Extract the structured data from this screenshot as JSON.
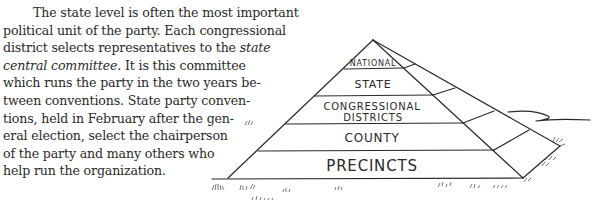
{
  "paragraph": {
    "lines": [
      "The state level is often the most important",
      "political unit of the party. Each congressional",
      "district selects representatives to the ",
      "state",
      "central committee",
      ". It is this committee",
      "which runs the party in the two years be-",
      "tween conventions. State party conven-",
      "tions, held in February after the gen-",
      "eral election, select the chairperson",
      "of the party and many others who",
      "help run the organization."
    ]
  },
  "pyramid": {
    "levels": [
      {
        "label": "NATIONAL"
      },
      {
        "label": "STATE"
      },
      {
        "label": "CONGRESSIONAL",
        "label2": "DISTRICTS"
      },
      {
        "label": "COUNTY"
      },
      {
        "label": "PRECINCTS"
      }
    ]
  }
}
